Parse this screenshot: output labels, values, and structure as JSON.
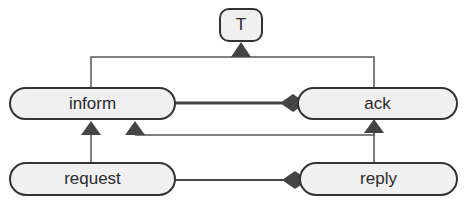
{
  "diagram": {
    "colors": {
      "node_fill": "#f0f0f0",
      "node_stroke": "#333333",
      "edge": "#555555",
      "arrowhead": "#444444"
    },
    "nodes": [
      {
        "id": "T",
        "label": "T",
        "shape": "rounded-rect"
      },
      {
        "id": "inform",
        "label": "inform",
        "shape": "pill"
      },
      {
        "id": "ack",
        "label": "ack",
        "shape": "pill"
      },
      {
        "id": "request",
        "label": "request",
        "shape": "pill"
      },
      {
        "id": "reply",
        "label": "reply",
        "shape": "pill"
      }
    ],
    "edges": [
      {
        "from": "inform",
        "to": "T",
        "type": "generalization"
      },
      {
        "from": "ack",
        "to": "T",
        "type": "generalization"
      },
      {
        "from": "request",
        "to": "inform",
        "type": "generalization"
      },
      {
        "from": "reply",
        "to": "ack",
        "type": "generalization"
      },
      {
        "from": "ack",
        "to": "inform",
        "type": "generalization"
      },
      {
        "from": "inform",
        "to": "ack",
        "type": "composition"
      },
      {
        "from": "request",
        "to": "reply",
        "type": "composition"
      }
    ]
  }
}
